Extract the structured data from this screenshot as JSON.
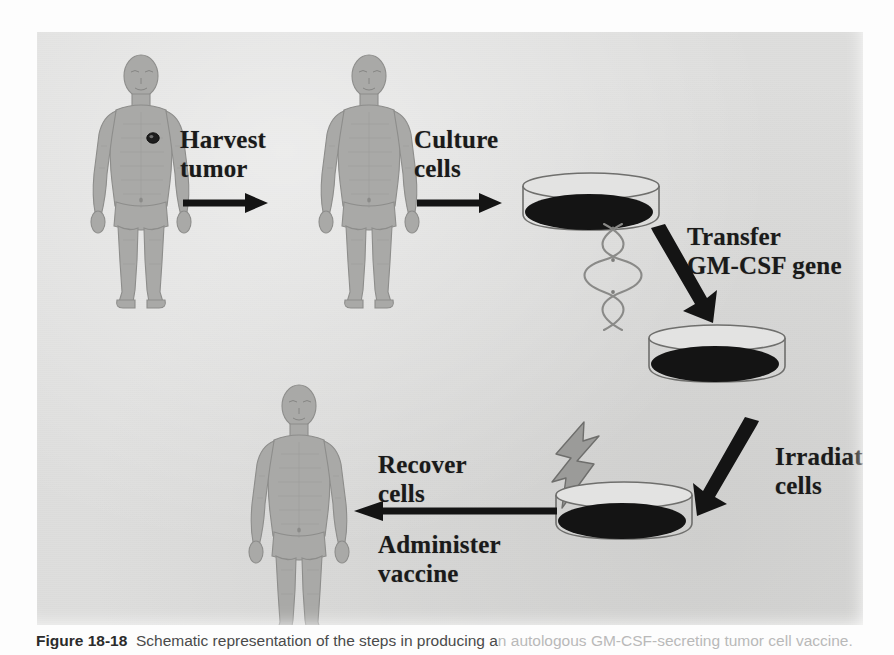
{
  "figure": {
    "panel_background": "#dededd",
    "ink_color": "#1a1a1a",
    "figure_fill": "#a9a9a7"
  },
  "steps": [
    {
      "id": "harvest",
      "label": "Harvest\ntumor",
      "order": 1
    },
    {
      "id": "culture",
      "label": "Culture\ncells",
      "order": 2
    },
    {
      "id": "transfer",
      "label": "Transfer\nGM-CSF gene",
      "order": 3
    },
    {
      "id": "irradiate",
      "label": "Irradiate\ncells",
      "order": 4
    },
    {
      "id": "recover",
      "label": "Recover\ncells",
      "order": 5
    },
    {
      "id": "administer",
      "label": "Administer\nvaccine",
      "order": 6
    }
  ],
  "objects": {
    "patient_with_tumor": "patient-with-tumor",
    "patient_after_harvest": "patient-after-harvest",
    "patient_vaccinated": "patient-vaccinated",
    "dish_culture": "petri-dish-cultured-cells",
    "dish_transfected": "petri-dish-transfected-cells",
    "dish_irradiated": "petri-dish-irradiated-cells",
    "dna": "dna-double-helix",
    "radiation": "radiation-lightning-bolt",
    "tumor": "tumor-lesion-marker"
  },
  "caption": {
    "number": "Figure 18-18",
    "text": "Schematic representation of the steps in producing a",
    "tail": "n autologous GM-CSF-secreting tumor cell vaccine."
  }
}
